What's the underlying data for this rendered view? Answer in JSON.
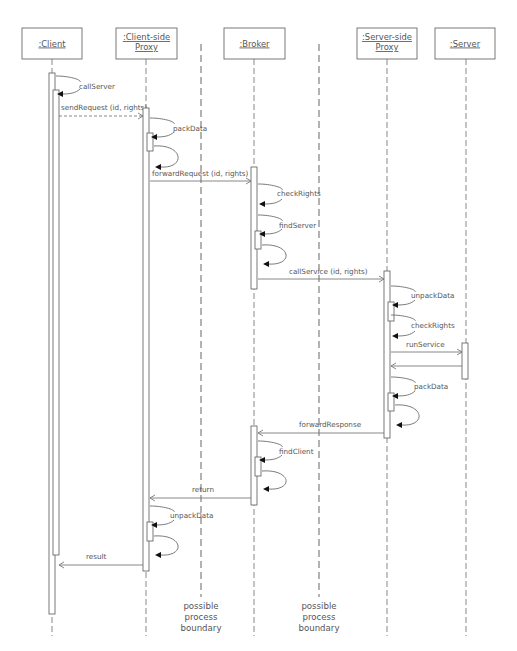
{
  "diagram": {
    "type": "uml-sequence-diagram",
    "objects": [
      {
        "id": "client",
        "lines": [
          ":Client"
        ],
        "box": [
          22,
          28,
          60,
          31
        ],
        "lifeline_x": 52
      },
      {
        "id": "client-proxy",
        "lines": [
          ":Client-side",
          "Proxy"
        ],
        "box": [
          116,
          28,
          61,
          31
        ],
        "lifeline_x": 146
      },
      {
        "id": "broker",
        "lines": [
          ":Broker"
        ],
        "box": [
          224,
          28,
          61,
          31
        ],
        "lifeline_x": 254
      },
      {
        "id": "server-proxy",
        "lines": [
          ":Server-side",
          "Proxy"
        ],
        "box": [
          357,
          28,
          60,
          31
        ],
        "lifeline_x": 387
      },
      {
        "id": "server",
        "lines": [
          ":Server"
        ],
        "box": [
          435,
          28,
          60,
          31
        ],
        "lifeline_x": 466
      }
    ],
    "lifeline_end_y": 636,
    "boundaries": [
      {
        "x": 201,
        "y1": 44,
        "y2": 597,
        "label": [
          "possible",
          "process",
          "boundary"
        ]
      },
      {
        "x": 319,
        "y1": 44,
        "y2": 597,
        "label": [
          "possible",
          "process",
          "boundary"
        ]
      }
    ],
    "activations": [
      {
        "x": 49,
        "y1": 73,
        "y2": 614
      },
      {
        "x": 53,
        "y1": 90,
        "y2": 555
      },
      {
        "x": 143,
        "y1": 108,
        "y2": 571
      },
      {
        "x": 147,
        "y1": 133,
        "y2": 151
      },
      {
        "x": 251,
        "y1": 167,
        "y2": 289
      },
      {
        "x": 255,
        "y1": 231,
        "y2": 249
      },
      {
        "x": 384,
        "y1": 271,
        "y2": 438
      },
      {
        "x": 388,
        "y1": 302,
        "y2": 321
      },
      {
        "x": 388,
        "y1": 393,
        "y2": 411
      },
      {
        "x": 462,
        "y1": 343,
        "y2": 379
      },
      {
        "x": 251,
        "y1": 426,
        "y2": 505
      },
      {
        "x": 255,
        "y1": 457,
        "y2": 476
      },
      {
        "x": 147,
        "y1": 522,
        "y2": 541
      }
    ],
    "messages": [
      {
        "label": "sendRequest (id, rights)",
        "from_x": 59,
        "to_x": 143,
        "y": 116,
        "style": "dashed",
        "head": "open",
        "label_x": 61,
        "label_y": 110
      },
      {
        "label": "forwardRequest (id, rights)",
        "from_x": 150,
        "to_x": 251,
        "y": 181,
        "style": "solid",
        "head": "open",
        "label_x": 152,
        "label_y": 176
      },
      {
        "label": "callService (id, rights)",
        "from_x": 258,
        "to_x": 384,
        "y": 279,
        "style": "solid",
        "head": "open",
        "label_x": 289,
        "label_y": 274
      },
      {
        "label": "runService",
        "from_x": 391,
        "to_x": 462,
        "y": 352,
        "style": "solid",
        "head": "open",
        "label_x": 406,
        "label_y": 347
      },
      {
        "label": "",
        "from_x": 462,
        "to_x": 391,
        "y": 366,
        "style": "solid",
        "head": "open",
        "label_x": 0,
        "label_y": 0
      },
      {
        "label": "forwardResponse",
        "from_x": 384,
        "to_x": 258,
        "y": 433,
        "style": "solid",
        "head": "open",
        "label_x": 299,
        "label_y": 427
      },
      {
        "label": "return",
        "from_x": 251,
        "to_x": 150,
        "y": 498,
        "style": "solid",
        "head": "open",
        "label_x": 192,
        "label_y": 492
      },
      {
        "label": "result",
        "from_x": 143,
        "to_x": 59,
        "y": 565,
        "style": "solid",
        "head": "open",
        "label_x": 86,
        "label_y": 559
      }
    ],
    "self_calls": [
      {
        "label": "callServer",
        "x": 56,
        "y_start": 76,
        "y_end": 94,
        "label_x": 79,
        "label_y": 89,
        "bulge": 26
      },
      {
        "label": "packData",
        "x": 150,
        "y_start": 118,
        "y_end": 137,
        "label_x": 173,
        "label_y": 131,
        "bulge": 26
      },
      {
        "label": "",
        "x": 154,
        "y_start": 146,
        "y_end": 167,
        "label_x": 0,
        "label_y": 0,
        "bulge": 26,
        "loop": true
      },
      {
        "label": "checkRights",
        "x": 258,
        "y_start": 184,
        "y_end": 204,
        "label_x": 277,
        "label_y": 196,
        "bulge": 26
      },
      {
        "label": "findServer",
        "x": 258,
        "y_start": 215,
        "y_end": 234,
        "label_x": 279,
        "label_y": 228,
        "bulge": 26
      },
      {
        "label": "",
        "x": 262,
        "y_start": 245,
        "y_end": 264,
        "label_x": 0,
        "label_y": 0,
        "bulge": 26,
        "loop": true
      },
      {
        "label": "unpackData",
        "x": 391,
        "y_start": 286,
        "y_end": 305,
        "label_x": 411,
        "label_y": 298,
        "bulge": 26
      },
      {
        "label": "checkRights",
        "x": 391,
        "y_start": 315,
        "y_end": 336,
        "label_x": 411,
        "label_y": 328,
        "bulge": 26
      },
      {
        "label": "packData",
        "x": 391,
        "y_start": 377,
        "y_end": 396,
        "label_x": 414,
        "label_y": 389,
        "bulge": 26
      },
      {
        "label": "",
        "x": 395,
        "y_start": 405,
        "y_end": 425,
        "label_x": 0,
        "label_y": 0,
        "bulge": 26,
        "loop": true
      },
      {
        "label": "findClient",
        "x": 258,
        "y_start": 441,
        "y_end": 460,
        "label_x": 279,
        "label_y": 454,
        "bulge": 26
      },
      {
        "label": "",
        "x": 262,
        "y_start": 471,
        "y_end": 489,
        "label_x": 0,
        "label_y": 0,
        "bulge": 26,
        "loop": true
      },
      {
        "label": "unpackData",
        "x": 150,
        "y_start": 506,
        "y_end": 525,
        "label_x": 170,
        "label_y": 518,
        "bulge": 26
      },
      {
        "label": "",
        "x": 154,
        "y_start": 536,
        "y_end": 555,
        "label_x": 0,
        "label_y": 0,
        "bulge": 26,
        "loop": true
      }
    ],
    "colors": {
      "line": "#7a7a7a",
      "text": "#555555",
      "arrowhead": "#111111",
      "background": "#ffffff"
    }
  }
}
